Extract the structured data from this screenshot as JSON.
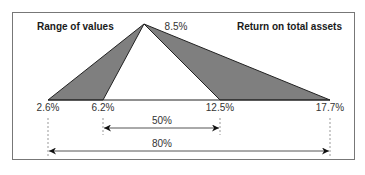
{
  "title_left": "Range of values",
  "title_right": "Return on total assets",
  "apex": {
    "label": "8.5%",
    "value": 8.5
  },
  "baseline_points": [
    {
      "label": "2.6%",
      "value": 2.6
    },
    {
      "label": "6.2%",
      "value": 6.2
    },
    {
      "label": "12.5%",
      "value": 12.5
    },
    {
      "label": "17.7%",
      "value": 17.7
    }
  ],
  "ranges": [
    {
      "label": "50%",
      "from": "6.2%",
      "to": "12.5%"
    },
    {
      "label": "80%",
      "from": "2.6%",
      "to": "17.7%"
    }
  ],
  "colors": {
    "frame": "#777777",
    "fill": "#7f7f7f",
    "line": "#222222",
    "dashed": "#999999",
    "arrow": "#555555"
  }
}
